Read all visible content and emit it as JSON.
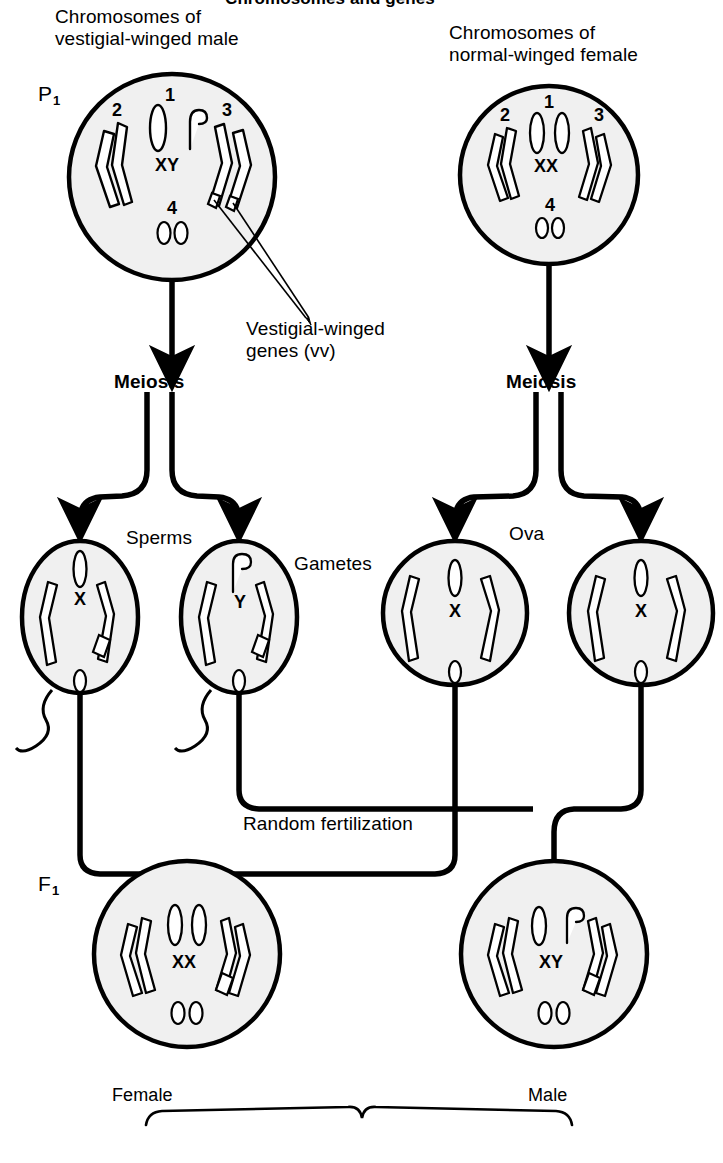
{
  "title": "Chromosomes and genes",
  "headers": {
    "male_parent": "Chromosomes of\nvestigial-winged male",
    "female_parent": "Chromosomes of\nnormal-winged female"
  },
  "stage_labels": {
    "parental": "P",
    "parental_sub": "1",
    "filial": "F",
    "filial_sub": "1"
  },
  "process_labels": {
    "meiosis_left": "Meiosis",
    "meiosis_right": "Meiosis",
    "sperms": "Sperms",
    "ova": "Ova",
    "gametes": "Gametes",
    "random_fertilization": "Random fertilization"
  },
  "annotation": {
    "gene_callout": "Vestigial-winged\ngenes (vv)"
  },
  "offspring_labels": {
    "female": "Female",
    "male": "Male"
  },
  "colors": {
    "ink": "#000000",
    "cell_fill": "#f0f0f0",
    "cell_stroke": "#000000",
    "chromosome_fill": "#ffffff",
    "background": "#ffffff"
  },
  "cells": {
    "p1_male": {
      "sex_chromosomes": "XY",
      "pair_numbers": [
        "1",
        "2",
        "3",
        "4"
      ],
      "dot_pair": "00",
      "gene_marks": 2
    },
    "p1_female": {
      "sex_chromosomes": "XX",
      "pair_numbers": [
        "1",
        "2",
        "3",
        "4"
      ],
      "dot_pair": "00",
      "gene_marks": 0
    },
    "sperm_x": {
      "sex_chromosome": "X",
      "dot": "0",
      "gene_marks": 1
    },
    "sperm_y": {
      "sex_chromosome": "Y",
      "dot": "0",
      "gene_marks": 1
    },
    "ovum_1": {
      "sex_chromosome": "X",
      "dot": "0",
      "gene_marks": 0
    },
    "ovum_2": {
      "sex_chromosome": "X",
      "dot": "0",
      "gene_marks": 0
    },
    "f1_female": {
      "sex_chromosomes": "XX",
      "dot_pair": "00",
      "gene_marks": 1
    },
    "f1_male": {
      "sex_chromosomes": "XY",
      "dot_pair": "00",
      "gene_marks": 1
    }
  }
}
